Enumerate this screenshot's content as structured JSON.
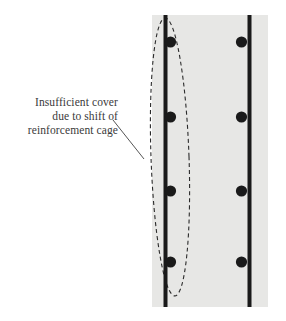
{
  "figure": {
    "name": "reinforcement-cover-defect-diagram",
    "type": "engineering-cross-section",
    "annotation": {
      "lines": [
        "Insufficient cover",
        "due to shift of",
        "reinforcement cage"
      ],
      "text_align": "right",
      "color": "#3a3a3a"
    },
    "leader_line": {
      "from": [
        113,
        120
      ],
      "to": [
        144,
        159
      ],
      "color": "#555555"
    },
    "highlight_ellipse": {
      "shape": "dashed-ellipse",
      "center": [
        170,
        157
      ],
      "rx": 19,
      "ry": 139,
      "rotation_deg": -2,
      "dash": "4,3",
      "color": "#2b2b2b"
    },
    "concrete_slab": {
      "label": "concrete-section",
      "x": 152,
      "y": 15,
      "width": 116,
      "height": 292,
      "fill": "#e7e7e5"
    },
    "rebar_bars": [
      {
        "name": "left-vertical-bar",
        "x": 163.5,
        "y_top": 15,
        "y_bottom": 307,
        "width": 4,
        "color": "#1a1a1a",
        "dot_side": "right"
      },
      {
        "name": "right-vertical-bar",
        "x": 247.5,
        "y_top": 15,
        "y_bottom": 307,
        "width": 4,
        "color": "#1a1a1a",
        "dot_side": "left"
      }
    ],
    "rebar_dots": {
      "radius": 5.6,
      "color": "#1a1a1a",
      "y_positions": [
        42,
        117,
        191,
        262
      ],
      "left_bar_cx": 170.5,
      "right_bar_cx": 241.5
    },
    "colors": {
      "concrete_fill": "#e7e7e5",
      "steel": "#1a1a1a",
      "text": "#3a3a3a",
      "background": "#ffffff"
    }
  }
}
